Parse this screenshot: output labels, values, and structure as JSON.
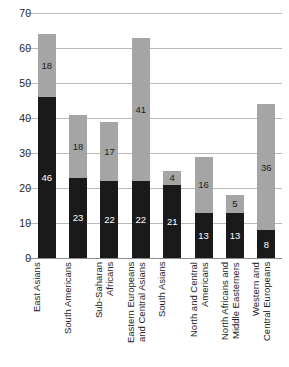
{
  "chart_data": {
    "type": "bar",
    "subtype": "stacked-vertical",
    "title": "",
    "xlabel": "",
    "ylabel": "",
    "ylim": [
      0,
      70
    ],
    "ytick_step": 10,
    "yticks": [
      0,
      10,
      20,
      30,
      40,
      50,
      60,
      70
    ],
    "grid": true,
    "legend": false,
    "categories": [
      "East Asians",
      "South Americans",
      "Sub-Saharan\nAfricans",
      "Eastern Europeans\nand Central Asians",
      "South Asians",
      "North and Central\nAmericans",
      "North Africans and\nMiddle Easterners",
      "Western and\nCentral Europeans"
    ],
    "series": [
      {
        "name": "bottom-segment",
        "color": "#1a1a1a",
        "values": [
          46,
          23,
          22,
          22,
          21,
          13,
          13,
          8
        ]
      },
      {
        "name": "top-segment",
        "color": "#a5a5a5",
        "values": [
          18,
          18,
          17,
          41,
          4,
          16,
          5,
          36
        ]
      }
    ],
    "totals": [
      64,
      41,
      39,
      63,
      25,
      29,
      18,
      44
    ]
  },
  "axis": {
    "ytick_labels": [
      "70",
      "60",
      "50",
      "40",
      "30",
      "20",
      "10",
      "0"
    ]
  },
  "colors": {
    "dark_segment": "#1a1a1a",
    "light_segment": "#a5a5a5",
    "gridline": "#b9b9b9",
    "baseline": "#8c8c8c",
    "text": "#1d1d1d",
    "background": "#ffffff"
  }
}
